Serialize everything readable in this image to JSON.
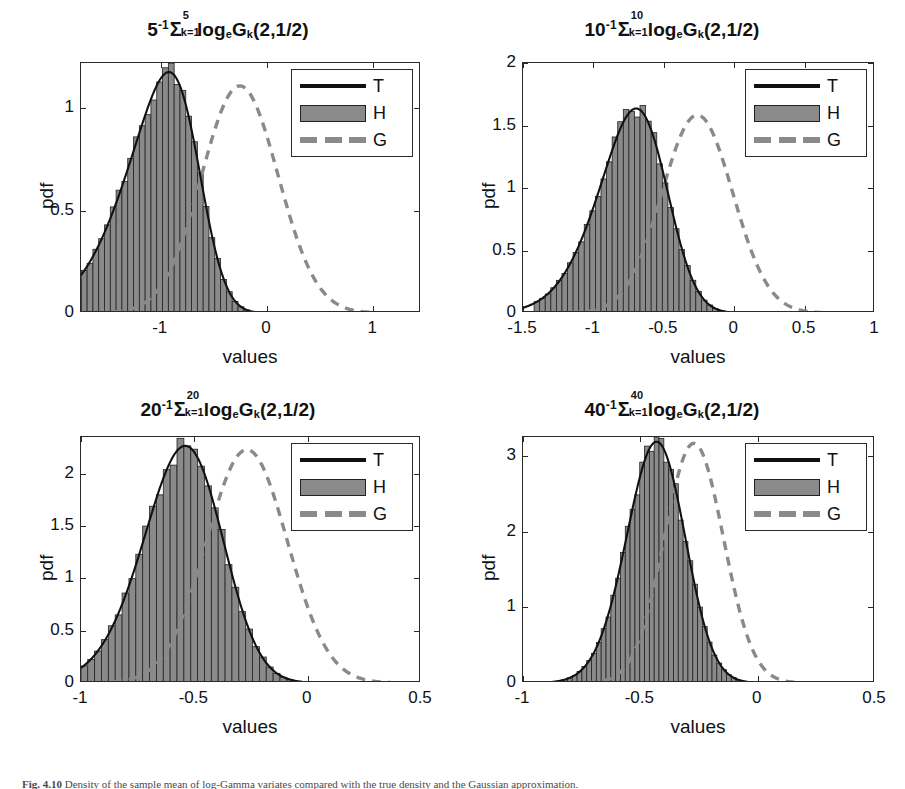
{
  "figure": {
    "caption_prefix": "Fig. 4.10",
    "caption_text": "Density of the sample mean of log-Gamma variates compared with the true density and the Gaussian approximation."
  },
  "legend": {
    "entries": [
      {
        "label": "T",
        "style": "solid-line",
        "color": "#111111"
      },
      {
        "label": "H",
        "style": "filled-patch",
        "color": "#8a8a8a"
      },
      {
        "label": "G",
        "style": "dashed-line",
        "color": "#8a8a8a"
      }
    ]
  },
  "colors": {
    "histogram_fill": "#8a8a8a",
    "histogram_edge": "#222222",
    "true_density": "#111111",
    "gaussian": "#8a8a8a",
    "axis": "#2a2a2a"
  },
  "chart_data": [
    {
      "type": "bar",
      "panel_index": 0,
      "title": "5^-1 Σ_{k=1}^{5} log_e G_k(2,1/2)",
      "title_parts": {
        "n": "5",
        "exponent": "-1",
        "sigma_upper": "5",
        "sigma_lower": "k=1",
        "log_base": "e",
        "variate": "G",
        "variate_sub": "k",
        "params": "(2,1/2)"
      },
      "xlabel": "values",
      "ylabel": "pdf",
      "xlim": [
        -1.75,
        1.45
      ],
      "ylim": [
        0,
        1.22
      ],
      "xticks": [
        -1,
        0,
        1
      ],
      "yticks": [
        0,
        0.5,
        1
      ],
      "grid": false,
      "legend_position": "top-right",
      "n_terms": 5,
      "peak_value": 1.12,
      "peak_location": -0.25,
      "series": [
        {
          "name": "H",
          "kind": "histogram",
          "mu": -0.255,
          "sigma": 0.36,
          "skew": -0.42,
          "n_bins": 58
        },
        {
          "name": "T",
          "kind": "line",
          "mu": -0.255,
          "sigma": 0.36,
          "skew": -0.42
        },
        {
          "name": "G",
          "kind": "dashed",
          "mu": -0.255,
          "sigma": 0.36,
          "skew": 0
        }
      ]
    },
    {
      "type": "bar",
      "panel_index": 1,
      "title": "10^-1 Σ_{k=1}^{10} log_e G_k(2,1/2)",
      "title_parts": {
        "n": "10",
        "exponent": "-1",
        "sigma_upper": "10",
        "sigma_lower": "k=1",
        "log_base": "e",
        "variate": "G",
        "variate_sub": "k",
        "params": "(2,1/2)"
      },
      "xlabel": "values",
      "ylabel": "pdf",
      "xlim": [
        -1.5,
        1.0
      ],
      "ylim": [
        0,
        2.0
      ],
      "xticks": [
        -1.5,
        -1,
        -0.5,
        0,
        0.5,
        1
      ],
      "yticks": [
        0,
        0.5,
        1,
        1.5,
        2
      ],
      "grid": false,
      "legend_position": "top-right",
      "n_terms": 10,
      "peak_value": 1.66,
      "peak_location": -0.24,
      "series": [
        {
          "name": "H",
          "kind": "histogram",
          "mu": -0.262,
          "sigma": 0.252,
          "skew": -0.3,
          "n_bins": 56
        },
        {
          "name": "T",
          "kind": "line",
          "mu": -0.262,
          "sigma": 0.252,
          "skew": -0.3
        },
        {
          "name": "G",
          "kind": "dashed",
          "mu": -0.262,
          "sigma": 0.252,
          "skew": 0
        }
      ]
    },
    {
      "type": "bar",
      "panel_index": 2,
      "title": "20^-1 Σ_{k=1}^{20} log_e G_k(2,1/2)",
      "title_parts": {
        "n": "20",
        "exponent": "-1",
        "sigma_upper": "20",
        "sigma_lower": "k=1",
        "log_base": "e",
        "variate": "G",
        "variate_sub": "k",
        "params": "(2,1/2)"
      },
      "xlabel": "values",
      "ylabel": "pdf",
      "xlim": [
        -1.0,
        0.5
      ],
      "ylim": [
        0,
        2.35
      ],
      "xticks": [
        -1,
        -0.5,
        0,
        0.5
      ],
      "yticks": [
        0,
        0.5,
        1,
        1.5,
        2
      ],
      "grid": false,
      "legend_position": "top-right",
      "n_terms": 20,
      "peak_value": 2.25,
      "peak_location": -0.27,
      "series": [
        {
          "name": "H",
          "kind": "histogram",
          "mu": -0.268,
          "sigma": 0.179,
          "skew": -0.22,
          "n_bins": 52
        },
        {
          "name": "T",
          "kind": "line",
          "mu": -0.268,
          "sigma": 0.179,
          "skew": -0.22
        },
        {
          "name": "G",
          "kind": "dashed",
          "mu": -0.268,
          "sigma": 0.179,
          "skew": 0
        }
      ]
    },
    {
      "type": "bar",
      "panel_index": 3,
      "title": "40^-1 Σ_{k=1}^{40} log_e G_k(2,1/2)",
      "title_parts": {
        "n": "40",
        "exponent": "-1",
        "sigma_upper": "40",
        "sigma_lower": "k=1",
        "log_base": "e",
        "variate": "G",
        "variate_sub": "k",
        "params": "(2,1/2)"
      },
      "xlabel": "values",
      "ylabel": "pdf",
      "xlim": [
        -1.0,
        0.5
      ],
      "ylim": [
        0,
        3.25
      ],
      "xticks": [
        -1,
        -0.5,
        0,
        0.5
      ],
      "yticks": [
        0,
        1,
        2,
        3
      ],
      "grid": false,
      "legend_position": "top-right",
      "n_terms": 40,
      "peak_value": 3.2,
      "peak_location": -0.27,
      "series": [
        {
          "name": "H",
          "kind": "histogram",
          "mu": -0.272,
          "sigma": 0.126,
          "skew": -0.16,
          "n_bins": 54
        },
        {
          "name": "T",
          "kind": "line",
          "mu": -0.272,
          "sigma": 0.126,
          "skew": -0.16
        },
        {
          "name": "G",
          "kind": "dashed",
          "mu": -0.272,
          "sigma": 0.126,
          "skew": 0
        }
      ]
    }
  ]
}
